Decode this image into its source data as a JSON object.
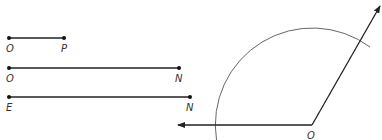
{
  "segments": [
    {
      "name": "segment-op",
      "start_label": "O",
      "end_label": "P"
    },
    {
      "name": "segment-on",
      "start_label": "O",
      "end_label": "N"
    },
    {
      "name": "segment-en",
      "start_label": "E",
      "end_label": "N"
    }
  ],
  "angle": {
    "vertex_label": "O",
    "has_arc": true
  },
  "colors": {
    "line": "#222222",
    "arc": "#555555",
    "background": "#ffffff"
  }
}
